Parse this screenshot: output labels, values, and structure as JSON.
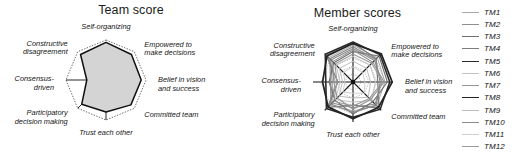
{
  "figure": {
    "background": "#ffffff",
    "panels": [
      "team",
      "member"
    ]
  },
  "team": {
    "title": "Team score",
    "axes": [
      "Self-organizing",
      "Empowered to make decisions",
      "Belief in vision and success",
      "Committed team",
      "Trust each other",
      "Participatory decision making",
      "Consensus-driven",
      "Constructive disagreement"
    ]
  },
  "member": {
    "title": "Member scores",
    "axes": [
      "Self-organizing",
      "Empowered to make decisions",
      "Belief in vision and success",
      "Committed team",
      "Trust each other",
      "Participatory decision making",
      "Consensus-driven",
      "Constructive disagreement"
    ]
  },
  "legend": {
    "position": "right",
    "entries": [
      {
        "label": "TM1",
        "color": "#a8a8a8",
        "width": 1.0
      },
      {
        "label": "TM2",
        "color": "#8e8e8e",
        "width": 1.1
      },
      {
        "label": "TM3",
        "color": "#6f6f6f",
        "width": 1.1
      },
      {
        "label": "TM4",
        "color": "#7d7d7d",
        "width": 1.3
      },
      {
        "label": "TM5",
        "color": "#2b2b2b",
        "width": 1.6
      },
      {
        "label": "TM6",
        "color": "#c3c3c3",
        "width": 1.0
      },
      {
        "label": "TM7",
        "color": "#949494",
        "width": 1.1
      },
      {
        "label": "TM8",
        "color": "#232323",
        "width": 1.7
      },
      {
        "label": "TM9",
        "color": "#bdbdbd",
        "width": 1.0
      },
      {
        "label": "TM10",
        "color": "#8a8a8a",
        "width": 1.2
      },
      {
        "label": "TM11",
        "color": "#cfcfcf",
        "width": 1.0
      },
      {
        "label": "TM12",
        "color": "#9b9b9b",
        "width": 1.1
      }
    ]
  },
  "chart_data": [
    {
      "type": "radar",
      "title": "Team score",
      "categories": [
        "Self-organizing",
        "Empowered to make decisions",
        "Belief in vision and success",
        "Committed team",
        "Trust each other",
        "Participatory decision making",
        "Consensus-driven",
        "Constructive disagreement"
      ],
      "rlim": [
        0,
        5
      ],
      "grid": true,
      "legend": "none",
      "series": [
        {
          "name": "Team score",
          "values": [
            4.7,
            4.5,
            4.4,
            4.4,
            4.0,
            4.3,
            2.4,
            4.5
          ],
          "fill": "#d4d4d4",
          "line": "#111111"
        }
      ],
      "reference_ring": {
        "name": "outer grid octagon",
        "values": [
          5,
          5,
          5,
          5,
          5,
          5,
          5,
          5
        ],
        "style": "dotted"
      }
    },
    {
      "type": "radar",
      "title": "Member scores",
      "categories": [
        "Self-organizing",
        "Empowered to make decisions",
        "Belief in vision and success",
        "Committed team",
        "Trust each other",
        "Participatory decision making",
        "Consensus-driven",
        "Constructive disagreement"
      ],
      "rlim": [
        0,
        5
      ],
      "grid": true,
      "legend": "right",
      "series": [
        {
          "name": "TM1",
          "color": "#a8a8a8",
          "width": 1.0,
          "values": [
            4.6,
            4.3,
            4.0,
            4.2,
            3.6,
            4.1,
            2.2,
            4.3
          ]
        },
        {
          "name": "TM2",
          "color": "#8e8e8e",
          "width": 1.1,
          "values": [
            4.2,
            3.8,
            3.6,
            3.9,
            3.2,
            3.7,
            2.6,
            3.9
          ]
        },
        {
          "name": "TM3",
          "color": "#6f6f6f",
          "width": 1.1,
          "values": [
            3.8,
            4.6,
            4.3,
            3.5,
            4.0,
            3.2,
            3.0,
            3.4
          ]
        },
        {
          "name": "TM4",
          "color": "#7d7d7d",
          "width": 1.3,
          "values": [
            4.9,
            4.1,
            3.1,
            4.6,
            2.9,
            4.5,
            1.9,
            4.7
          ]
        },
        {
          "name": "TM5",
          "color": "#2b2b2b",
          "width": 1.6,
          "values": [
            5.0,
            4.8,
            4.6,
            4.8,
            4.4,
            4.7,
            3.4,
            4.9
          ]
        },
        {
          "name": "TM6",
          "color": "#c3c3c3",
          "width": 1.0,
          "values": [
            3.2,
            3.0,
            2.8,
            3.3,
            2.5,
            3.1,
            1.6,
            3.0
          ]
        },
        {
          "name": "TM7",
          "color": "#949494",
          "width": 1.1,
          "values": [
            4.0,
            3.5,
            3.9,
            3.1,
            3.4,
            2.8,
            2.4,
            3.6
          ]
        },
        {
          "name": "TM8",
          "color": "#232323",
          "width": 1.7,
          "values": [
            4.8,
            5.0,
            4.9,
            4.5,
            4.6,
            4.4,
            3.8,
            4.6
          ]
        },
        {
          "name": "TM9",
          "color": "#bdbdbd",
          "width": 1.0,
          "values": [
            2.6,
            2.4,
            2.2,
            2.7,
            2.0,
            2.5,
            1.3,
            2.4
          ]
        },
        {
          "name": "TM10",
          "color": "#8a8a8a",
          "width": 1.2,
          "values": [
            4.4,
            4.0,
            3.4,
            4.1,
            3.8,
            3.9,
            2.8,
            4.1
          ]
        },
        {
          "name": "TM11",
          "color": "#cfcfcf",
          "width": 1.0,
          "values": [
            1.9,
            1.7,
            1.5,
            2.0,
            1.4,
            1.8,
            1.0,
            1.7
          ]
        },
        {
          "name": "TM12",
          "color": "#9b9b9b",
          "width": 1.1,
          "values": [
            3.5,
            3.3,
            3.7,
            2.9,
            3.0,
            3.4,
            2.0,
            3.2
          ]
        }
      ]
    }
  ]
}
